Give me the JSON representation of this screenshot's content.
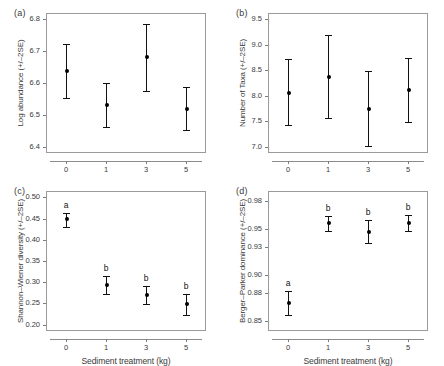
{
  "figure": {
    "xlabel": "Sediment treatment (kg)",
    "x_categories": [
      "0",
      "1",
      "3",
      "5"
    ]
  },
  "chart_data": [
    {
      "type": "scatter",
      "panel": "(a)",
      "title": "",
      "xlabel": "",
      "ylabel": "Log abundance (+/–2SE)",
      "categories": [
        "0",
        "1",
        "3",
        "5"
      ],
      "values": [
        6.638,
        6.53,
        6.681,
        6.519
      ],
      "err_low": [
        6.553,
        6.461,
        6.576,
        6.452
      ],
      "err_high": [
        6.723,
        6.601,
        6.785,
        6.586
      ],
      "yticks": [
        "6.4",
        "6.5",
        "6.6",
        "6.7",
        "6.8"
      ],
      "ytick_values": [
        6.4,
        6.5,
        6.6,
        6.7,
        6.8
      ],
      "ylim": [
        6.38,
        6.82
      ],
      "grid": false,
      "legend": "none",
      "sig_letters": [
        "",
        "",
        "",
        ""
      ]
    },
    {
      "type": "scatter",
      "panel": "(b)",
      "title": "",
      "xlabel": "",
      "ylabel": "Number of Taxa (+/–2SE)",
      "categories": [
        "0",
        "1",
        "3",
        "5"
      ],
      "values": [
        8.06,
        8.37,
        7.75,
        8.11
      ],
      "err_low": [
        7.42,
        7.56,
        7.01,
        7.49
      ],
      "err_high": [
        8.71,
        9.19,
        8.49,
        8.73
      ],
      "yticks": [
        "7.0",
        "7.5",
        "8.0",
        "8.5",
        "9.0",
        "9.5"
      ],
      "ytick_values": [
        7.0,
        7.5,
        8.0,
        8.5,
        9.0,
        9.5
      ],
      "ylim": [
        6.88,
        9.62
      ],
      "grid": false,
      "legend": "none",
      "sig_letters": [
        "",
        "",
        "",
        ""
      ]
    },
    {
      "type": "scatter",
      "panel": "(c)",
      "title": "",
      "xlabel": "Sediment treatment (kg)",
      "ylabel": "Shannon–Wiener diversity (+/–2SE)",
      "categories": [
        "0",
        "1",
        "3",
        "5"
      ],
      "values": [
        0.448,
        0.294,
        0.271,
        0.248
      ],
      "err_low": [
        0.431,
        0.273,
        0.249,
        0.222
      ],
      "err_high": [
        0.464,
        0.315,
        0.292,
        0.273
      ],
      "yticks": [
        "0.20",
        "0.25",
        "0.30",
        "0.35",
        "0.40",
        "0.45",
        "0.50"
      ],
      "ytick_values": [
        0.2,
        0.25,
        0.3,
        0.35,
        0.4,
        0.45,
        0.5
      ],
      "ylim": [
        0.185,
        0.515
      ],
      "grid": false,
      "legend": "none",
      "sig_letters": [
        "a",
        "b",
        "b",
        "b"
      ]
    },
    {
      "type": "scatter",
      "panel": "(d)",
      "title": "",
      "xlabel": "Sediment treatment (kg)",
      "ylabel": "Berger–Parker dominance (+/–2SE)",
      "categories": [
        "0",
        "1",
        "3",
        "5"
      ],
      "values": [
        0.8695,
        0.9555,
        0.9465,
        0.9558
      ],
      "err_low": [
        0.8565,
        0.9475,
        0.9345,
        0.9472
      ],
      "err_high": [
        0.8825,
        0.9635,
        0.9592,
        0.9648
      ],
      "yticks": [
        "0.85",
        "0.88",
        "0.90",
        "0.93",
        "0.95",
        "0.98"
      ],
      "ytick_values": [
        0.85,
        0.88,
        0.9,
        0.93,
        0.95,
        0.98
      ],
      "ylim": [
        0.8395,
        0.9905
      ],
      "grid": false,
      "legend": "none",
      "sig_letters": [
        "a",
        "b",
        "b",
        "b"
      ]
    }
  ]
}
